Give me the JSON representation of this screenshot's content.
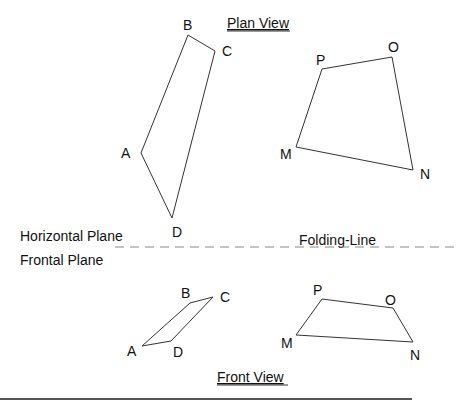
{
  "titles": {
    "plan_view": "Plan View",
    "front_view": "Front View"
  },
  "planes": {
    "horizontal": "Horizontal Plane",
    "frontal": "Frontal Plane",
    "folding_line": "Folding-Line"
  },
  "plan_view": {
    "abcd": {
      "A": {
        "label": "A"
      },
      "B": {
        "label": "B"
      },
      "C": {
        "label": "C"
      },
      "D": {
        "label": "D"
      }
    },
    "mnop": {
      "M": {
        "label": "M"
      },
      "N": {
        "label": "N"
      },
      "O": {
        "label": "O"
      },
      "P": {
        "label": "P"
      }
    }
  },
  "front_view": {
    "abcd": {
      "A": {
        "label": "A"
      },
      "B": {
        "label": "B"
      },
      "C": {
        "label": "C"
      },
      "D": {
        "label": "D"
      }
    },
    "mnop": {
      "M": {
        "label": "M"
      },
      "N": {
        "label": "N"
      },
      "O": {
        "label": "O"
      },
      "P": {
        "label": "P"
      }
    }
  },
  "colors": {
    "line": "#333333",
    "dash": "#888888",
    "text": "#111111"
  }
}
